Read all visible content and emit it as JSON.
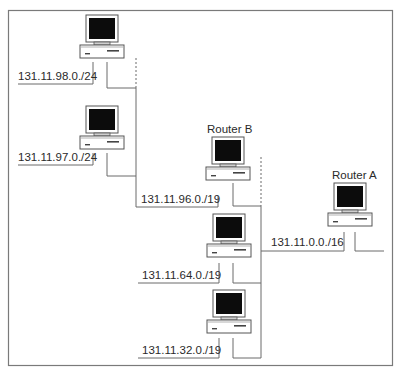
{
  "diagram": {
    "type": "network-topology",
    "routers": [
      {
        "id": "router-b",
        "label": "Router B"
      },
      {
        "id": "router-a",
        "label": "Router A"
      }
    ],
    "subnets": [
      {
        "id": "subnet-98",
        "label": "131.11.98.0./24"
      },
      {
        "id": "subnet-97",
        "label": "131.11.97.0./24"
      },
      {
        "id": "subnet-96",
        "label": "131.11.96.0./19"
      },
      {
        "id": "subnet-64",
        "label": "131.11.64.0./19"
      },
      {
        "id": "subnet-32",
        "label": "131.11.32.0./19"
      },
      {
        "id": "subnet-0",
        "label": "131.11.0.0./16"
      }
    ],
    "colors": {
      "frame": "#7a7a7a",
      "wire": "#6a6a6a",
      "screen": "#0c0c0c",
      "text": "#2a2a2a"
    }
  }
}
